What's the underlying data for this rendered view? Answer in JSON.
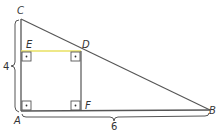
{
  "diagram": {
    "type": "geometry-right-triangle-with-inscribed-square",
    "points": {
      "A": {
        "label": "A",
        "x": 21,
        "y": 111
      },
      "B": {
        "label": "B",
        "x": 210,
        "y": 110
      },
      "C": {
        "label": "C",
        "x": 21,
        "y": 19
      },
      "D": {
        "label": "D",
        "x": 81,
        "y": 51
      },
      "E": {
        "label": "E",
        "x": 21,
        "y": 51
      },
      "F": {
        "label": "F",
        "x": 81,
        "y": 111
      }
    },
    "dimensions": {
      "AC": "4",
      "AB": "6"
    },
    "right_angles": [
      "A",
      "E",
      "D",
      "F"
    ],
    "colors": {
      "stroke": "#555555",
      "highlight_segment": "#e8e060",
      "text": "#333333"
    }
  }
}
